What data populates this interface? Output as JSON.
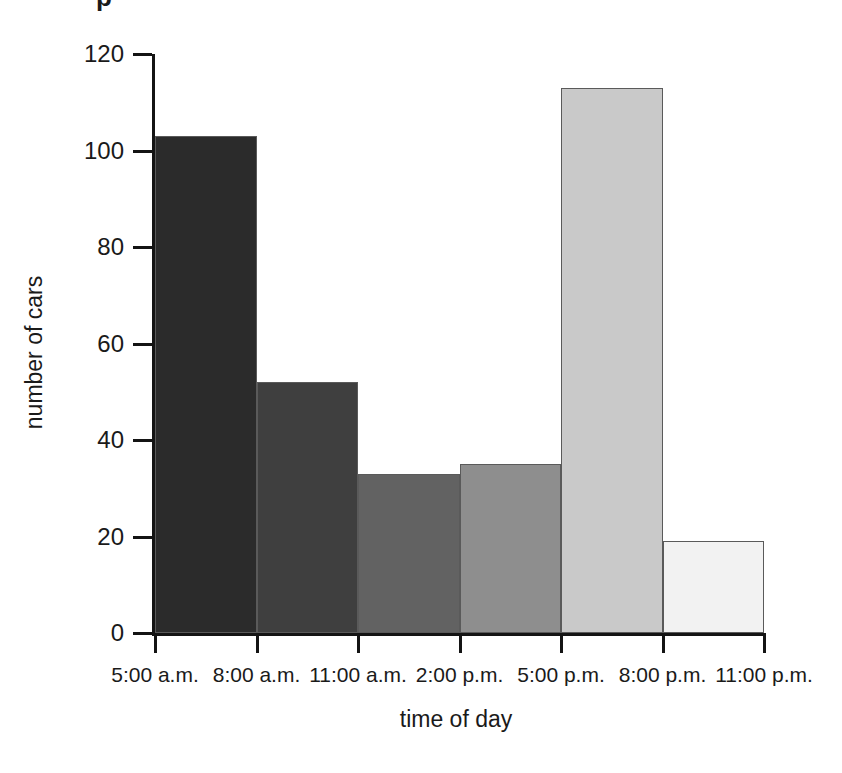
{
  "figure": {
    "top_fragment_glyph": "p",
    "background_color": "#ffffff",
    "ink_color": "#1a1a1a"
  },
  "chart_data": {
    "type": "bar",
    "title": "",
    "subtitle": "",
    "xlabel": "time of day",
    "ylabel": "number of cars",
    "categories": [
      "5:00 a.m. - 8:00 a.m.",
      "8:00 a.m. - 11:00 a.m.",
      "11:00 a.m. - 2:00 p.m.",
      "2:00 p.m. - 5:00 p.m.",
      "5:00 p.m. - 8:00 p.m.",
      "8:00 p.m. - 11:00 p.m."
    ],
    "values": [
      103,
      52,
      33,
      35,
      113,
      19
    ],
    "bar_colors": [
      "#2b2b2b",
      "#3f3f3f",
      "#626262",
      "#8e8e8e",
      "#c9c9c9",
      "#f2f2f2"
    ],
    "x_tick_labels": [
      "5:00 a.m.",
      "8:00 a.m.",
      "11:00 a.m.",
      "2:00 p.m.",
      "5:00 p.m.",
      "8:00 p.m.",
      "11:00 p.m."
    ],
    "y_tick_labels": [
      "0",
      "20",
      "40",
      "60",
      "80",
      "100",
      "120"
    ],
    "y_tick_values": [
      0,
      20,
      40,
      60,
      80,
      100,
      120
    ],
    "ylim": [
      0,
      120
    ],
    "grid": false,
    "legend": false,
    "legend_position": "none",
    "bars_touching": true,
    "annotations": []
  }
}
